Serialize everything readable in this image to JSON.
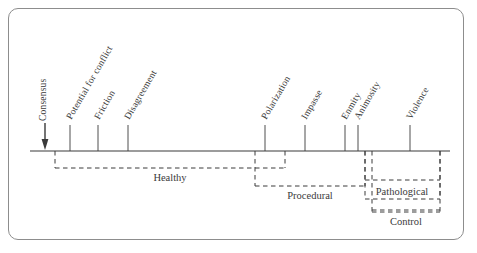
{
  "figure": {
    "type": "continuum-diagram",
    "background": "#ffffff",
    "frame_color": "#8d8d8d",
    "line_color": "#3a3a3a",
    "axis": {
      "y": 151,
      "x_start": 30,
      "x_end": 450
    },
    "start_marker": {
      "name": "arrow-marker",
      "x": 45
    }
  },
  "chart_data": {
    "type": "line",
    "title": "",
    "xlabel": "",
    "ylabel": "",
    "categories": [
      "Consensus",
      "Potential for conflict",
      "Friction",
      "Disagreement",
      "Polarization",
      "Impasse",
      "Enmity",
      "Animosity",
      "Violence"
    ],
    "x": [
      45,
      70,
      98,
      128,
      265,
      305,
      345,
      358,
      410
    ],
    "values": [
      0,
      1,
      2,
      3,
      4,
      5,
      6,
      7,
      8
    ],
    "grid": false,
    "legend": "none",
    "annotations": [
      "Healthy",
      "Procedural",
      "Pathological",
      "Control"
    ]
  },
  "points": [
    {
      "label": "Consensus",
      "x": 45,
      "rotation": 90,
      "stem": false,
      "arrow": true
    },
    {
      "label": "Potential for conflict",
      "x": 70,
      "rotation": 60,
      "stem": true,
      "arrow": false
    },
    {
      "label": "Friction",
      "x": 98,
      "rotation": 60,
      "stem": true,
      "arrow": false
    },
    {
      "label": "Disagreement",
      "x": 128,
      "rotation": 60,
      "stem": true,
      "arrow": false
    },
    {
      "label": "Polarization",
      "x": 265,
      "rotation": 60,
      "stem": true,
      "arrow": false
    },
    {
      "label": "Impasse",
      "x": 305,
      "rotation": 60,
      "stem": true,
      "arrow": false
    },
    {
      "label": "Enmity",
      "x": 345,
      "rotation": 60,
      "stem": true,
      "arrow": false
    },
    {
      "label": "Animosity",
      "x": 358,
      "rotation": 60,
      "stem": true,
      "arrow": false
    },
    {
      "label": "Violence",
      "x": 410,
      "rotation": 60,
      "stem": true,
      "arrow": false
    }
  ],
  "brackets": [
    {
      "label": "Healthy",
      "left": 55,
      "right": 285,
      "bottom": 168,
      "label_x": 170,
      "label_y": 172,
      "boxed": false
    },
    {
      "label": "Procedural",
      "left": 255,
      "right": 365,
      "bottom": 186,
      "label_x": 310,
      "label_y": 190,
      "boxed": false
    },
    {
      "label": "Pathological",
      "left": 365,
      "right": 440,
      "bottom": 199,
      "label_x": 402,
      "label_y": 186,
      "boxed": true
    },
    {
      "label": "Control",
      "left": 372,
      "right": 440,
      "bottom": 212,
      "label_x": 406,
      "label_y": 216,
      "boxed": true
    }
  ]
}
